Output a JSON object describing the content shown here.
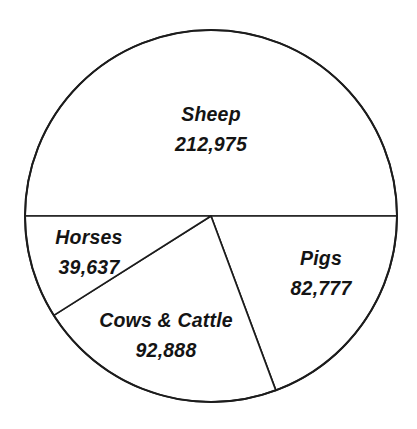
{
  "chart_data": {
    "type": "pie",
    "title": "",
    "subtitle": "",
    "xlabel": "",
    "ylabel": "",
    "legend_position": "none",
    "grid": false,
    "labels_inside_slices": true,
    "categories": [
      "Sheep",
      "Pigs",
      "Cows & Cattle",
      "Horses"
    ],
    "values": [
      212975,
      82777,
      92888,
      39637
    ],
    "value_labels": [
      "212,975",
      "82,777",
      "92,888",
      "39,637"
    ],
    "total": 428277,
    "slices": [
      {
        "label": "Sheep",
        "value": 212975,
        "value_label": "212,975",
        "percent": 49.7,
        "start_angle_deg": 180,
        "end_angle_deg": 360,
        "label_x": 211,
        "label_y": 121,
        "value_x": 211,
        "value_y": 151
      },
      {
        "label": "Pigs",
        "value": 82777,
        "value_label": "82,777",
        "percent": 19.3,
        "start_angle_deg": 0,
        "end_angle_deg": 69.6,
        "label_x": 321,
        "label_y": 265,
        "value_x": 321,
        "value_y": 295
      },
      {
        "label": "Cows & Cattle",
        "value": 92888,
        "value_label": "92,888",
        "percent": 21.7,
        "start_angle_deg": 69.6,
        "end_angle_deg": 147.7,
        "label_x": 166,
        "label_y": 327,
        "value_x": 166,
        "value_y": 357
      },
      {
        "label": "Horses",
        "value": 39637,
        "value_label": "39,637",
        "percent": 9.3,
        "start_angle_deg": 147.7,
        "end_angle_deg": 180,
        "label_x": 89,
        "label_y": 244,
        "value_x": 89,
        "value_y": 274
      }
    ],
    "geometry": {
      "center_x": 211,
      "center_y": 216,
      "radius": 186
    },
    "colors": {
      "slice_fill": "#ffffff",
      "stroke": "#1c1c1c",
      "text": "#141414",
      "background": "#ffffff"
    }
  }
}
